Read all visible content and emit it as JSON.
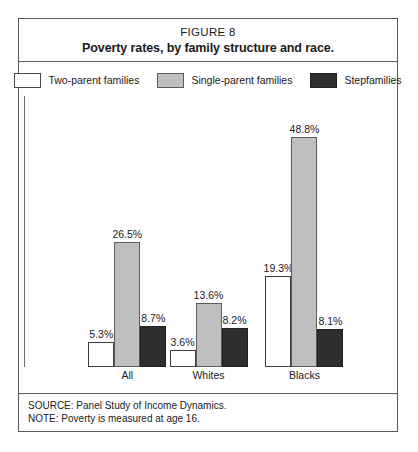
{
  "figure": {
    "number": "FIGURE 8",
    "title": "Poverty rates, by family structure and race."
  },
  "legend": {
    "entries": [
      {
        "label": "Two-parent families",
        "color": "#ffffff",
        "swatch_name": "legend-swatch-two-parent"
      },
      {
        "label": "Single-parent families",
        "color": "#bfbfbf",
        "swatch_name": "legend-swatch-single-parent"
      },
      {
        "label": "Stepfamilies",
        "color": "#2e2e2e",
        "swatch_name": "legend-swatch-stepfamily"
      }
    ]
  },
  "footer": {
    "source": "SOURCE: Panel Study of Income Dynamics.",
    "note": "NOTE: Poverty is measured at age 16."
  },
  "chart_data": {
    "type": "bar",
    "title": "Poverty rates, by family structure and race.",
    "subtitle": "FIGURE 8",
    "xlabel": "",
    "ylabel": "",
    "ylim": [
      0,
      52
    ],
    "grid": false,
    "legend_position": "top",
    "value_suffix": "%",
    "categories": [
      "All",
      "Whites",
      "Blacks"
    ],
    "series": [
      {
        "name": "Two-parent families",
        "color": "#ffffff",
        "values": [
          5.3,
          3.6,
          19.3
        ],
        "labels": [
          "5.3%",
          "3.6%",
          "19.3%"
        ]
      },
      {
        "name": "Single-parent families",
        "color": "#bfbfbf",
        "values": [
          26.5,
          13.6,
          48.8
        ],
        "labels": [
          "26.5%",
          "13.6%",
          "48.8%"
        ]
      },
      {
        "name": "Stepfamilies",
        "color": "#2e2e2e",
        "values": [
          8.7,
          8.2,
          8.1
        ],
        "labels": [
          "8.7%",
          "8.2%",
          "8.1%"
        ]
      }
    ]
  }
}
